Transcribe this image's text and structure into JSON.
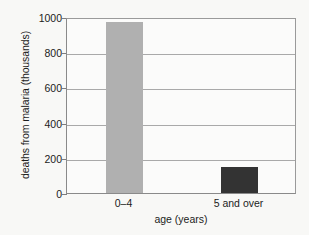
{
  "chart_data": {
    "type": "bar",
    "title": "",
    "xlabel": "age (years)",
    "ylabel": "deaths from malaria (thousands)",
    "categories": [
      "0–4",
      "5 and over"
    ],
    "values": [
      970,
      150
    ],
    "ylim": [
      0,
      1000
    ],
    "yticks": [
      0,
      200,
      400,
      600,
      800,
      1000
    ],
    "ytick_labels": [
      "0",
      "200",
      "400",
      "600",
      "800",
      "1000"
    ],
    "grid": true,
    "legend": "none",
    "bar_colors": [
      "#b0b0b0",
      "#333333"
    ],
    "series": [
      {
        "name": "deaths from malaria",
        "values": [
          970,
          150
        ]
      }
    ]
  },
  "style": {
    "background": "#f8f8f6",
    "plot_background": "#fbfbfa",
    "axis_color": "#8a8a8a",
    "grid_color": "#a9a9a9",
    "text_color": "#1c1c1c"
  }
}
